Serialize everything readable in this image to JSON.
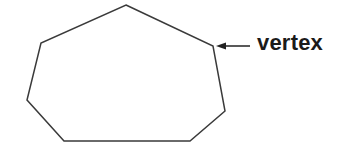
{
  "diagram": {
    "shape": "heptagon",
    "vertices": [
      [
        126,
        5
      ],
      [
        213,
        46
      ],
      [
        225,
        111
      ],
      [
        190,
        141
      ],
      [
        64,
        141
      ],
      [
        27,
        100
      ],
      [
        41,
        43
      ]
    ],
    "stroke_color": "#3a3a3a",
    "annotation": {
      "label": "vertex",
      "arrow_from": [
        250,
        46
      ],
      "arrow_to": [
        216,
        46
      ]
    }
  }
}
